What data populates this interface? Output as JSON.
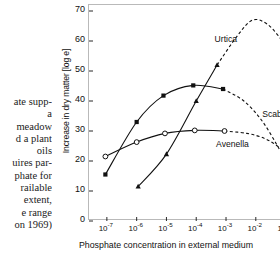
{
  "caption": {
    "lines": [
      "ate supp-",
      "a",
      "meadow",
      "d a plant",
      "oils",
      "uires par-",
      "phate for",
      "railable",
      "extent,",
      "e range",
      "on 1969)"
    ]
  },
  "chart_data": {
    "type": "line",
    "title": "",
    "xlabel": "Phosphate concentration in external medium",
    "ylabel": "Increase in dry matter [log e]",
    "x_unit": "Mol · l",
    "x_unit_exp": "-1",
    "x_scale": "log",
    "x_tick_labels": [
      "10-7",
      "10-6",
      "10-5",
      "10-4",
      "10-3",
      "10-2",
      "10-1"
    ],
    "x_tick_mantissa": "10",
    "x_tick_exponents": [
      "-7",
      "-6",
      "-5",
      "-4",
      "-3",
      "-2",
      "-1"
    ],
    "xlim_exp": [
      -7.6,
      -0.55
    ],
    "y_tick_labels": [
      "0",
      "10",
      "20",
      "30",
      "40",
      "50",
      "60",
      "70"
    ],
    "ylim": [
      0,
      72
    ],
    "grid": false,
    "legend": "inline-labels",
    "series": [
      {
        "name": "Urtica",
        "marker": "filled-triangle",
        "line": "solid-then-dashed",
        "label_x_exp": -3.35,
        "label_y": 60,
        "points": [
          {
            "x_exp": -5.95,
            "y": 11.5
          },
          {
            "x_exp": -5.0,
            "y": 22.3
          },
          {
            "x_exp": -4.0,
            "y": 40.0
          },
          {
            "x_exp": -3.3,
            "y": 52.0
          }
        ],
        "extrapolated": [
          {
            "x_exp": -3.3,
            "y": 52.0
          },
          {
            "x_exp": -2.6,
            "y": 62.0
          },
          {
            "x_exp": -2.1,
            "y": 67.0
          },
          {
            "x_exp": -1.6,
            "y": 65.5
          },
          {
            "x_exp": -1.1,
            "y": 60.0
          }
        ]
      },
      {
        "name": "Scabiosa",
        "marker": "filled-square",
        "line": "solid-then-dashed",
        "label_x_exp": -1.75,
        "label_y": 35,
        "points": [
          {
            "x_exp": -7.05,
            "y": 15.5
          },
          {
            "x_exp": -6.0,
            "y": 33.0
          },
          {
            "x_exp": -5.1,
            "y": 41.8
          },
          {
            "x_exp": -4.1,
            "y": 45.2
          },
          {
            "x_exp": -3.1,
            "y": 44.0
          }
        ],
        "extrapolated": [
          {
            "x_exp": -3.1,
            "y": 44.0
          },
          {
            "x_exp": -2.4,
            "y": 40.0
          },
          {
            "x_exp": -1.8,
            "y": 33.5
          },
          {
            "x_exp": -1.3,
            "y": 25.5
          },
          {
            "x_exp": -0.95,
            "y": 19.0
          }
        ]
      },
      {
        "name": "Avenella",
        "marker": "open-circle",
        "line": "solid-then-dashed",
        "label_x_exp": -3.3,
        "label_y": 25,
        "points": [
          {
            "x_exp": -7.05,
            "y": 21.5
          },
          {
            "x_exp": -6.0,
            "y": 26.3
          },
          {
            "x_exp": -5.05,
            "y": 29.2
          },
          {
            "x_exp": -4.05,
            "y": 30.2
          },
          {
            "x_exp": -3.05,
            "y": 30.0
          }
        ],
        "extrapolated": [
          {
            "x_exp": -3.05,
            "y": 30.0
          },
          {
            "x_exp": -2.3,
            "y": 29.2
          },
          {
            "x_exp": -1.7,
            "y": 27.5
          },
          {
            "x_exp": -1.25,
            "y": 24.8
          },
          {
            "x_exp": -0.95,
            "y": 22.0
          }
        ]
      }
    ]
  },
  "colors": {
    "ink": "#111111",
    "frame": "#b9b9b9",
    "background": "#ffffff"
  }
}
